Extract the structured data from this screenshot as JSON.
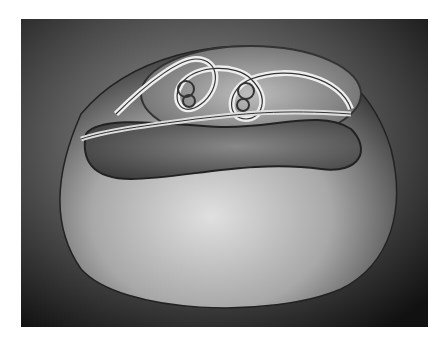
{
  "image": {
    "description": "Pencil drawing of a smooth rounded blob-like surface with an embedded looping tube forming a knotted figure-eight at the top containing small spiral loops",
    "colors": {
      "background": "#ffffff",
      "frame_dark": "#1a1a1a",
      "surface_light": "#cfcfcf",
      "surface_mid": "#8a8a8a",
      "shadow": "#2a2a2a"
    }
  }
}
